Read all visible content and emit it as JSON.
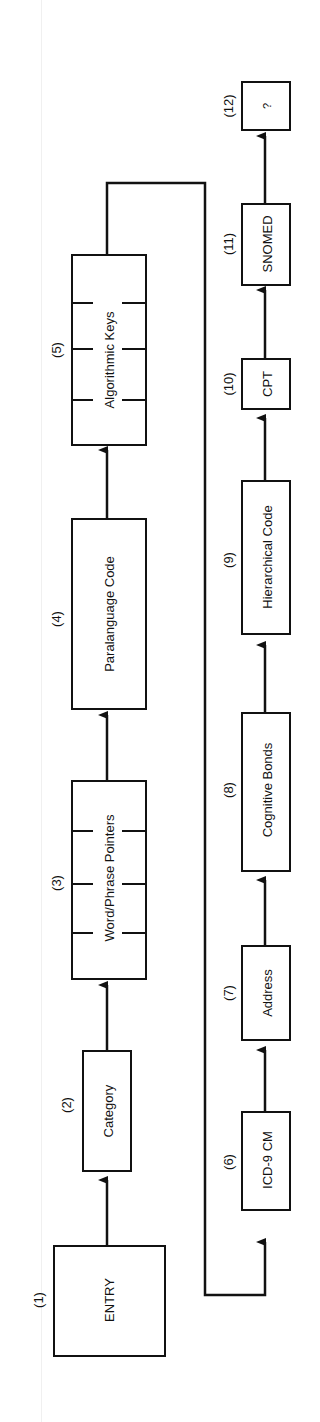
{
  "diagram": {
    "orientation": "rotated-90-ccw",
    "nodes": [
      {
        "id": 1,
        "num": "(1)",
        "label": "ENTRY"
      },
      {
        "id": 2,
        "num": "(2)",
        "label": "Category"
      },
      {
        "id": 3,
        "num": "(3)",
        "label": "Word/Phrase Pointers"
      },
      {
        "id": 4,
        "num": "(4)",
        "label": "Paralanguage Code"
      },
      {
        "id": 5,
        "num": "(5)",
        "label": "Algorithmic Keys"
      },
      {
        "id": 6,
        "num": "(6)",
        "label": "ICD-9 CM"
      },
      {
        "id": 7,
        "num": "(7)",
        "label": "Address"
      },
      {
        "id": 8,
        "num": "(8)",
        "label": "Cognitive Bonds"
      },
      {
        "id": 9,
        "num": "(9)",
        "label": "Hierarchical Code"
      },
      {
        "id": 10,
        "num": "(10)",
        "label": "CPT"
      },
      {
        "id": 11,
        "num": "(11)",
        "label": "SNOMED"
      },
      {
        "id": 12,
        "num": "(12)",
        "label": "?"
      }
    ],
    "edges": [
      [
        1,
        2
      ],
      [
        2,
        3
      ],
      [
        3,
        4
      ],
      [
        4,
        5
      ],
      [
        5,
        6
      ],
      [
        6,
        7
      ],
      [
        7,
        8
      ],
      [
        8,
        9
      ],
      [
        9,
        10
      ],
      [
        10,
        11
      ],
      [
        11,
        12
      ]
    ]
  }
}
